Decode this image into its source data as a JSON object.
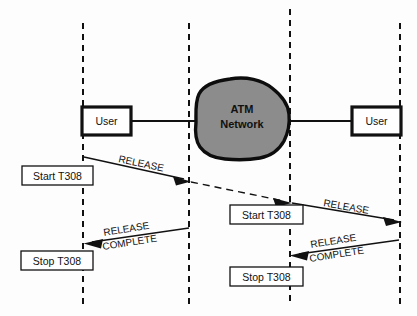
{
  "diagram": {
    "background_color": "#fdfdfd",
    "cloud_fill_color": "#8c8c8c",
    "line_color": "#111111",
    "lifelines": [
      {
        "name": "lifeline-left-user",
        "x": 83
      },
      {
        "name": "lifeline-left-network",
        "x": 189
      },
      {
        "name": "lifeline-right-network",
        "x": 290
      },
      {
        "name": "lifeline-right-user",
        "x": 400
      }
    ],
    "nodes": {
      "left_user": {
        "label": "User",
        "x": 82,
        "y": 107,
        "w": 49,
        "h": 28
      },
      "right_user": {
        "label": "User",
        "x": 352,
        "y": 107,
        "w": 49,
        "h": 28
      },
      "network": {
        "line1": "ATM",
        "line2": "Network"
      }
    },
    "timer_boxes": [
      {
        "name": "timer-box-start-left",
        "label": "Start T308",
        "x": 22,
        "y": 166,
        "w": 71,
        "h": 19
      },
      {
        "name": "timer-box-start-right",
        "label": "Start T308",
        "x": 230,
        "y": 205,
        "w": 73,
        "h": 19
      },
      {
        "name": "timer-box-stop-left",
        "label": "Stop T308",
        "x": 21,
        "y": 251,
        "w": 72,
        "h": 19
      },
      {
        "name": "timer-box-stop-right",
        "label": "Stop T308",
        "x": 230,
        "y": 267,
        "w": 73,
        "h": 19
      }
    ],
    "messages": [
      {
        "name": "message-release-left",
        "label_line1": "RELEASE",
        "label_line2": "",
        "style": "solid",
        "from": {
          "x": 84,
          "y": 157
        },
        "to": {
          "x": 190,
          "y": 181
        },
        "label_x": 118,
        "label_y": 160,
        "label_rotate": 12
      },
      {
        "name": "message-release-transit",
        "label_line1": "",
        "label_line2": "",
        "style": "dashed",
        "from": {
          "x": 191,
          "y": 182
        },
        "to": {
          "x": 291,
          "y": 203
        },
        "label_x": 0,
        "label_y": 0,
        "label_rotate": 0
      },
      {
        "name": "message-release-right",
        "label_line1": "RELEASE",
        "label_line2": "",
        "style": "solid",
        "from": {
          "x": 291,
          "y": 203
        },
        "to": {
          "x": 401,
          "y": 222
        },
        "label_x": 322,
        "label_y": 203,
        "label_rotate": 10
      },
      {
        "name": "message-release-complete-left",
        "label_line1": "RELEASE",
        "label_line2": "COMPLETE",
        "style": "solid",
        "from": {
          "x": 189,
          "y": 228
        },
        "to": {
          "x": 84,
          "y": 244
        },
        "label_x": 106,
        "label_y": 237,
        "label_rotate": -9
      },
      {
        "name": "message-release-complete-right",
        "label_line1": "RELEASE",
        "label_line2": "COMPLETE",
        "style": "solid",
        "from": {
          "x": 399,
          "y": 240
        },
        "to": {
          "x": 290,
          "y": 256
        },
        "label_x": 312,
        "label_y": 249,
        "label_rotate": -9
      }
    ]
  }
}
